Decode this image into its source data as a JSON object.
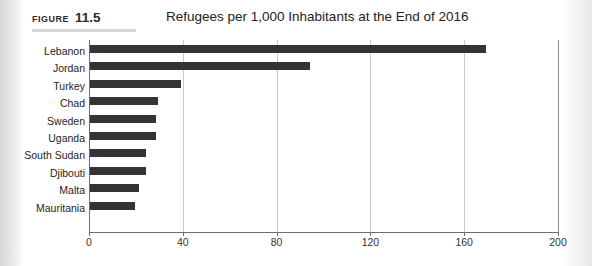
{
  "figure": {
    "label_word": "FIGURE",
    "label_number": "11.5"
  },
  "chart_data": {
    "type": "bar",
    "orientation": "horizontal",
    "title": "Refugees per 1,000 Inhabitants at the End of 2016",
    "xlabel": "",
    "ylabel": "",
    "categories": [
      "Lebanon",
      "Jordan",
      "Turkey",
      "Chad",
      "Sweden",
      "Uganda",
      "South Sudan",
      "Djibouti",
      "Malta",
      "Mauritania"
    ],
    "values": [
      169,
      94,
      39,
      29,
      28,
      28,
      24,
      24,
      21,
      19
    ],
    "xlim": [
      0,
      200
    ],
    "xticks": [
      0,
      40,
      80,
      120,
      160,
      200
    ],
    "xtick_labels": [
      "0",
      "40",
      "80",
      "120",
      "160",
      "200"
    ],
    "grid": true,
    "grid_axis": "x",
    "legend": false,
    "bar_color": "#343434",
    "gridline_color": "#c9c9cc",
    "axis_color": "#6e6e72"
  }
}
